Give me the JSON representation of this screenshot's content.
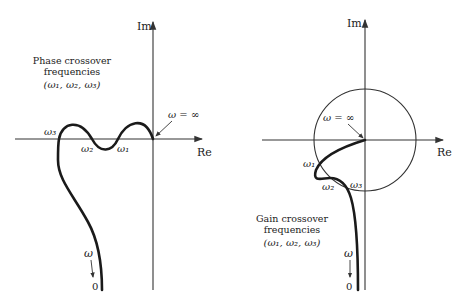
{
  "left_plot": {
    "axis_im_label": "Im",
    "axis_re_label": "Re",
    "annotation_line1": "Phase crossover",
    "annotation_line2": "frequencies",
    "annotation_line3": "(ω₁, ω₂, ω₃)",
    "omega_inf_label": "ω = ∞",
    "omega1": "ω₁",
    "omega2": "ω₂",
    "omega3": "ω₃",
    "omega_label": "ω",
    "zero_label": "0"
  },
  "right_plot": {
    "axis_im_label": "Im",
    "axis_re_label": "Re",
    "annotation_line1": "Gain crossover",
    "annotation_line2": "frequencies",
    "annotation_line3": "(ω₁, ω₂, ω₃)",
    "omega_inf_label": "ω = ∞",
    "omega1": "ω₁",
    "omega2": "ω₂",
    "omega3": "ω₃",
    "omega_label": "ω",
    "zero_label": "0",
    "unit_circle": true
  },
  "colors": {
    "curve": "#1a1a1a",
    "axis": "#333333",
    "background": "#ffffff"
  }
}
